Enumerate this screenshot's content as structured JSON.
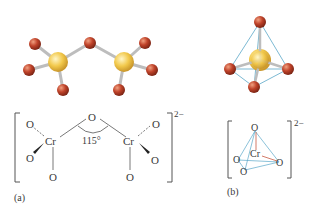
{
  "figure": {
    "panel_a": {
      "label": "(a)",
      "charge": "2−",
      "angle": "115°",
      "atom_O": "O",
      "atom_Cr": "Cr",
      "caption_role": "dichromate ion ball-and-stick and structural formula"
    },
    "panel_b": {
      "label": "(b)",
      "charge": "2−",
      "atom_O": "O",
      "atom_Cr": "Cr",
      "caption_role": "chromate ion tetrahedral model and structural formula"
    },
    "colors": {
      "chromium": "#f2c94c",
      "oxygen": "#c0432a",
      "bond": "#c8c8c8",
      "tetra_edge": "#5aa7c8",
      "text": "#3a3a3a"
    }
  }
}
